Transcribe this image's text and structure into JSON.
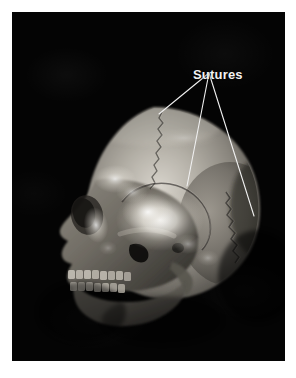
{
  "figure": {
    "type": "anatomical-photograph",
    "background_color": "#040404",
    "frame_color": "#ffffff",
    "plate": {
      "x": 12,
      "y": 12,
      "width": 273,
      "height": 349
    }
  },
  "annotations": {
    "labels": [
      {
        "id": "sutures",
        "text": "Sutures",
        "color": "#f2f2f2",
        "x": 181,
        "y": 55,
        "font_size_px": 13,
        "font_weight": "bold"
      }
    ],
    "leader_lines": {
      "color": "#f0f0f0",
      "width_px": 1.1,
      "origin": {
        "x": 209,
        "y": 73
      },
      "targets": [
        {
          "id": "coronal-suture-vertex",
          "x": 159,
          "y": 114
        },
        {
          "id": "squamous-suture-junction",
          "x": 187,
          "y": 186
        },
        {
          "id": "lambdoid-suture-occipital",
          "x": 254,
          "y": 216
        }
      ]
    }
  },
  "skull": {
    "highlights": [
      {
        "id": "parietal-eminence-glare",
        "cx": 148,
        "cy": 208,
        "rx": 42,
        "ry": 30
      },
      {
        "id": "frontal-bone-glare",
        "cx": 103,
        "cy": 167,
        "rx": 20,
        "ry": 14
      },
      {
        "id": "orbit-rim-glare",
        "cx": 84,
        "cy": 213,
        "rx": 13,
        "ry": 19
      },
      {
        "id": "temporal-line-glare",
        "cx": 120,
        "cy": 180,
        "rx": 16,
        "ry": 11
      }
    ],
    "features": [
      "cranial-vault",
      "frontal-bone",
      "parietal-bone",
      "occipital-bone",
      "temporal-bone",
      "orbit",
      "nasal-aperture",
      "zygomatic-arch",
      "maxilla",
      "mandible",
      "upper-teeth-row",
      "lower-teeth-row",
      "external-auditory-meatus"
    ]
  }
}
